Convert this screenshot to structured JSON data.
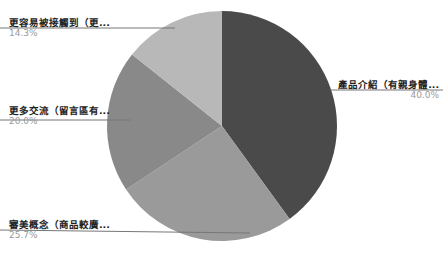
{
  "chart_data": {
    "type": "pie",
    "title": "",
    "start_angle": "12 o'clock",
    "direction": "clockwise",
    "slices": [
      {
        "label": "產品介紹（有親身體...",
        "value": 40.0,
        "pct_label": "40.0%",
        "color": "#4a4a4a"
      },
      {
        "label": "審美概念（商品較廣...",
        "value": 25.7,
        "pct_label": "25.7%",
        "color": "#9a9a9a"
      },
      {
        "label": "更多交流（留言區有...",
        "value": 20.0,
        "pct_label": "20.0%",
        "color": "#898989"
      },
      {
        "label": "更容易被接觸到（更...",
        "value": 14.3,
        "pct_label": "14.3%",
        "color": "#b8b8b8"
      }
    ],
    "legend": "none",
    "labels": "outside with leader lines"
  },
  "layout": {
    "cx": 222,
    "cy": 126,
    "r": 115
  }
}
